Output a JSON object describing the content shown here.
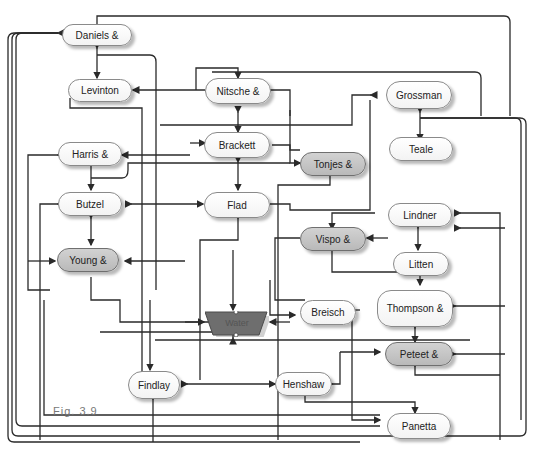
{
  "figure": {
    "label": "Fig. 3.9"
  },
  "nodes": {
    "daniels": {
      "label": "Daniels &"
    },
    "levinton": {
      "label": "Levinton"
    },
    "nitsche": {
      "label": "Nitsche &"
    },
    "grossman": {
      "label": "Grossman"
    },
    "harris": {
      "label": "Harris &"
    },
    "brackett": {
      "label": "Brackett"
    },
    "tonjes": {
      "label": "Tonjes &"
    },
    "teale": {
      "label": "Teale"
    },
    "butzel": {
      "label": "Butzel"
    },
    "flad": {
      "label": "Flad"
    },
    "lindner": {
      "label": "Lindner"
    },
    "vispo": {
      "label": "Vispo &"
    },
    "young": {
      "label": "Young &"
    },
    "litten": {
      "label": "Litten"
    },
    "water": {
      "label": "Water"
    },
    "breisch": {
      "label": "Breisch"
    },
    "thompson": {
      "label": "Thompson &"
    },
    "peteet": {
      "label": "Peteet &"
    },
    "findlay": {
      "label": "Findlay"
    },
    "henshaw": {
      "label": "Henshaw"
    },
    "panetta": {
      "label": "Panetta"
    }
  },
  "colors": {
    "line": "#2a2a2a",
    "gray_node": "#c4c4c4",
    "water": "#6e6e6e"
  }
}
